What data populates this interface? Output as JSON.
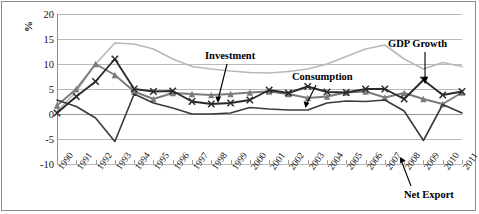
{
  "chart_data": {
    "type": "line",
    "title": "",
    "xlabel": "",
    "ylabel": "%",
    "ylim": [
      -10,
      20
    ],
    "yticks": [
      20,
      15,
      10,
      5,
      0,
      -5,
      -10
    ],
    "grid": true,
    "legend_position": "inline-annotations",
    "categories": [
      "1990",
      "1991",
      "1992",
      "1993",
      "1994",
      "1995",
      "1996",
      "1997",
      "1998",
      "1999",
      "2000",
      "2001",
      "2002",
      "2003",
      "2004",
      "2005",
      "2006",
      "2007",
      "2008",
      "2009",
      "2010",
      "2011"
    ],
    "series": [
      {
        "name": "Investment",
        "color": "#b8b8b8",
        "marker": "none",
        "values": [
          0.5,
          4.5,
          10.0,
          14.2,
          14.0,
          13.0,
          11.0,
          9.5,
          9.0,
          8.6,
          8.3,
          8.2,
          8.5,
          9.0,
          10.0,
          11.5,
          13.0,
          13.8,
          11.0,
          9.0,
          10.3,
          9.5
        ]
      },
      {
        "name": "GDP Growth",
        "color": "#7b7b7b",
        "marker": "triangle",
        "values": [
          1.7,
          5.0,
          10.0,
          7.8,
          4.5,
          3.0,
          4.2,
          4.0,
          3.8,
          4.0,
          4.3,
          4.5,
          4.0,
          3.2,
          3.5,
          4.3,
          4.5,
          3.3,
          4.2,
          3.0,
          2.0,
          4.3
        ]
      },
      {
        "name": "Consumption",
        "color": "#2b2b2b",
        "marker": "x",
        "values": [
          0.2,
          3.5,
          6.5,
          11.0,
          5.0,
          4.5,
          4.6,
          2.5,
          2.0,
          2.2,
          2.8,
          4.8,
          4.2,
          5.5,
          4.4,
          4.3,
          5.0,
          5.0,
          3.0,
          6.8,
          3.8,
          4.5
        ]
      },
      {
        "name": "Net Export",
        "color": "#3a3a3a",
        "marker": "none",
        "values": [
          2.8,
          1.5,
          -0.8,
          -5.5,
          4.0,
          2.2,
          1.2,
          0.0,
          0.0,
          0.2,
          1.3,
          1.0,
          0.8,
          0.8,
          2.2,
          2.6,
          2.5,
          2.8,
          0.6,
          -5.3,
          1.9,
          0.2
        ]
      }
    ],
    "annotations": [
      {
        "name": "Investment",
        "label": "Investment"
      },
      {
        "name": "Consumption",
        "label": "Consumption"
      },
      {
        "name": "GDP Growth",
        "label": "GDP Growth"
      },
      {
        "name": "Net Export",
        "label": "Net Export"
      }
    ]
  }
}
